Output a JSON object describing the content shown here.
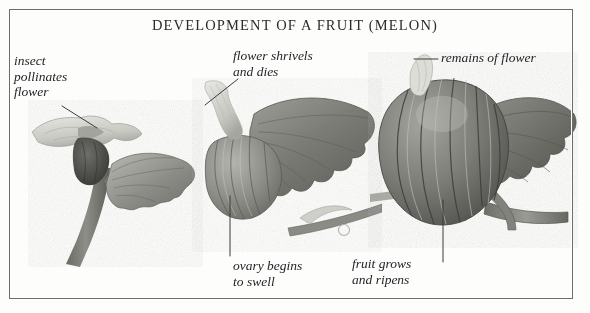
{
  "plate": {
    "title": "DEVELOPMENT OF A FRUIT (MELON)",
    "subject": "melon",
    "style": "engraved grayscale botanical plate",
    "frame": {
      "visible": true,
      "color": "#6d6d6d"
    },
    "background_color": "#fdfdfc",
    "ink_color": "#24242a"
  },
  "labels": {
    "insect": "insect\npollinates\nflower",
    "shrivels": "flower shrivels\nand dies",
    "remains": "remains of flower",
    "ovary": "ovary begins\nto swell",
    "fruit": "fruit grows\nand ripens"
  },
  "stages": [
    {
      "name": "stage-1-flowering",
      "caption_ref": "insect",
      "parts": [
        "open pale flower",
        "dark ovary",
        "serrated leaf",
        "thick stem"
      ]
    },
    {
      "name": "stage-2-young-fruit",
      "caption_ref": "ovary",
      "parts": [
        "shrivelled flower",
        "small ribbed ovary",
        "large leaf",
        "stem with tendril"
      ]
    },
    {
      "name": "stage-3-ripening-fruit",
      "caption_ref": "fruit",
      "parts": [
        "dried flower remains",
        "large ribbed melon",
        "leaf",
        "thick stalk"
      ]
    }
  ],
  "leaders": [
    {
      "name": "leader-insect",
      "from": [
        62,
        106
      ],
      "to": [
        97,
        128
      ]
    },
    {
      "name": "leader-shrivels",
      "from": [
        238,
        79
      ],
      "to": [
        205,
        105
      ]
    },
    {
      "name": "leader-remains",
      "from": [
        438,
        59
      ],
      "to": [
        414,
        59
      ]
    },
    {
      "name": "leader-ovary",
      "from": [
        230,
        196
      ],
      "to": [
        230,
        256
      ]
    },
    {
      "name": "leader-fruit",
      "from": [
        443,
        200
      ],
      "to": [
        443,
        262
      ]
    }
  ]
}
